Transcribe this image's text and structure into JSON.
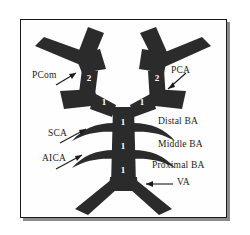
{
  "figure": {
    "kind": "anatomical-line-diagram",
    "vessel_color": "#2b2b2b",
    "background_color": "#ffffff",
    "frame_color": "#1a1a1a",
    "marker_color": "#ffffff"
  },
  "labels": {
    "pcom": "PCom",
    "pca": "PCA",
    "sca": "SCA",
    "aica": "AICA",
    "distal_ba": "Distal BA",
    "middle_ba": "Middle BA",
    "proximal_ba": "Proximal BA",
    "va": "VA"
  },
  "markers": {
    "left_p2": "2",
    "right_p2": "2",
    "left_p1": "1",
    "right_p1": "1",
    "basilar_top": "1",
    "basilar_upper_mid": "1",
    "basilar_lower_mid": "1",
    "basilar_bottom": "1"
  },
  "icons": {
    "pcom_arrow": "arrow-up-right-icon",
    "pca_arrow": "arrow-down-left-icon",
    "sca_arrow": "arrow-up-right-icon",
    "aica_arrow": "arrow-up-right-icon",
    "va_arrow": "arrow-left-icon"
  }
}
